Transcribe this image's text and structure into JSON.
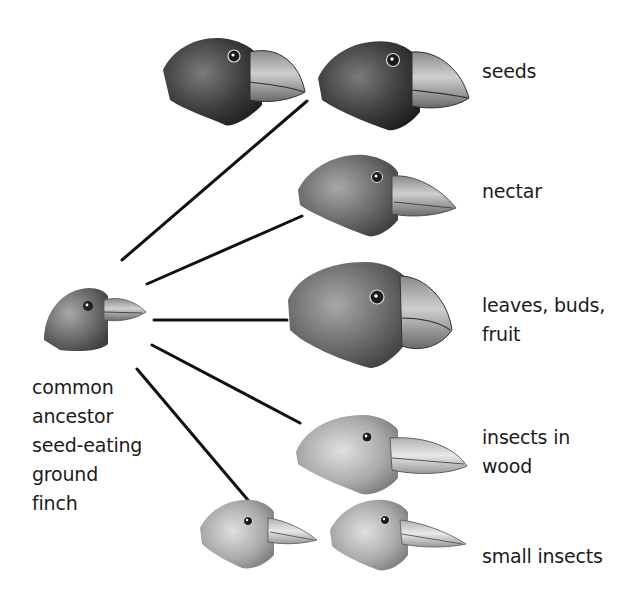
{
  "diagram": {
    "ancestor": {
      "label_lines": [
        "common",
        "ancestor",
        "seed-eating",
        "ground",
        "finch"
      ]
    },
    "descendants": [
      {
        "id": "seeds",
        "label_lines": [
          "seeds"
        ],
        "bird_count": 2
      },
      {
        "id": "nectar",
        "label_lines": [
          "nectar"
        ],
        "bird_count": 1
      },
      {
        "id": "leaves",
        "label_lines": [
          "leaves, buds,",
          "fruit"
        ],
        "bird_count": 1
      },
      {
        "id": "insects-wood",
        "label_lines": [
          "insects in",
          "wood"
        ],
        "bird_count": 1
      },
      {
        "id": "small-insects",
        "label_lines": [
          "small insects"
        ],
        "bird_count": 2
      }
    ],
    "colors": {
      "line": "#111111",
      "background": "#ffffff",
      "text": "#1b1b1b"
    }
  }
}
